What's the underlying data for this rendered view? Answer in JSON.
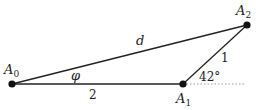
{
  "diagram": {
    "points": [
      {
        "id": "A0",
        "label": "A",
        "sub": "0",
        "x": 12,
        "y": 84
      },
      {
        "id": "A1",
        "label": "A",
        "sub": "1",
        "x": 183,
        "y": 84
      },
      {
        "id": "A2",
        "label": "A",
        "sub": "2",
        "x": 247,
        "y": 25
      }
    ],
    "edges": {
      "base_label": "2",
      "arm_label": "1",
      "diag_label": "d"
    },
    "angles": {
      "phi_label": "φ",
      "a1_label": "42°"
    },
    "colors": {
      "line": "#222222",
      "point": "#111111",
      "dotted": "#999999"
    }
  }
}
